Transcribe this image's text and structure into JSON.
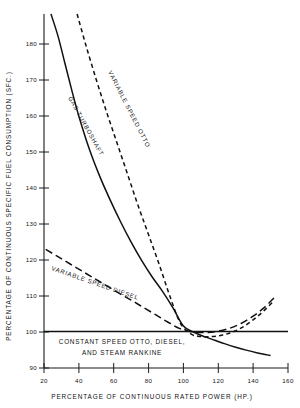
{
  "chart_data": {
    "type": "line",
    "title": "",
    "xlabel": "PERCENTAGE OF CONTINUOUS RATED POWER (HP.)",
    "ylabel": "PERCENTAGE OF CONTINUOUS SPECIFIC FUEL CONSUMPTION (SFC.)",
    "xlim": [
      20,
      160
    ],
    "ylim": [
      90,
      187
    ],
    "xticks": [
      20,
      40,
      60,
      80,
      100,
      120,
      140,
      160
    ],
    "xticklabels": [
      "20",
      "40",
      "60",
      "80",
      "100",
      "120",
      "140",
      "160"
    ],
    "yticks": [
      90,
      100,
      110,
      120,
      130,
      140,
      150,
      160,
      170,
      180
    ],
    "yticklabels": [
      "90",
      "100",
      "110",
      "120",
      "130",
      "140",
      "150",
      "160",
      "170",
      "180"
    ],
    "grid": false,
    "legend_position": "inline-curve-labels",
    "series": [
      {
        "name": "GAS TURBOSHAFT",
        "style": "solid",
        "color": "#111111",
        "label_text": "GAS TURBOSHAFT",
        "x": [
          24,
          28,
          32,
          36,
          40,
          46,
          52,
          58,
          64,
          70,
          76,
          82,
          88,
          94,
          100,
          106,
          112,
          118,
          124,
          130,
          136,
          142,
          148,
          150
        ],
        "y": [
          187,
          181,
          173.5,
          166,
          159,
          150,
          142.5,
          136,
          130,
          124.5,
          119.5,
          115,
          111,
          106.5,
          101.5,
          99.8,
          98.6,
          97.6,
          96.6,
          95.7,
          94.9,
          94.2,
          93.6,
          93.4
        ]
      },
      {
        "name": "VARIABLE SPEED OTTO",
        "style": "short-dash",
        "color": "#111111",
        "label_text": "VARIABLE SPEED OTTO",
        "x": [
          39,
          44,
          50,
          56,
          62,
          68,
          74,
          80,
          86,
          92,
          98,
          104,
          110,
          116,
          122,
          128,
          134,
          140,
          146,
          152
        ],
        "y": [
          187,
          178.5,
          169,
          160,
          151.5,
          143,
          134.5,
          126.5,
          118.5,
          110,
          102.5,
          99.4,
          98.6,
          98.6,
          99.0,
          99.8,
          101.2,
          103.2,
          105.6,
          108.4
        ]
      },
      {
        "name": "VARIABLE SPEED DIESEL",
        "style": "long-dash",
        "color": "#111111",
        "label_text": "VARIABLE SPEED DIESEL",
        "x": [
          21,
          28,
          35,
          42,
          49,
          56,
          63,
          70,
          77,
          84,
          91,
          98,
          105,
          112,
          119,
          126,
          133,
          140,
          146,
          152
        ],
        "y": [
          122.5,
          120.5,
          118.5,
          116.5,
          114.5,
          112.5,
          110.5,
          108.6,
          106.6,
          104.6,
          102.6,
          100.8,
          99.9,
          99.7,
          100.0,
          100.8,
          102.2,
          104.2,
          106.4,
          109.2
        ]
      },
      {
        "name": "CONSTANT SPEED OTTO, DIESEL, AND STEAM RANKINE",
        "style": "solid-flat",
        "color": "#111111",
        "label_line_1": "CONSTANT SPEED OTTO, DIESEL,",
        "label_line_2": "AND STEAM RANKINE",
        "x": [
          20,
          160
        ],
        "y": [
          100,
          100
        ]
      }
    ]
  }
}
